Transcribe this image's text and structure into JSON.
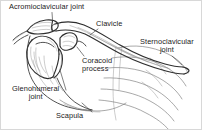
{
  "figure": {
    "type": "anatomical-line-illustration",
    "background_color": "#ffffff",
    "ink_color": "#3a3a3a",
    "text_color": "#1b1b1b",
    "width": 202,
    "height": 130
  },
  "labels": {
    "acromioclavicular_joint": "Acromioclavicular joint",
    "clavicle": "Clavicle",
    "sternoclavicular_joint_line1": "Sternoclavicular",
    "sternoclavicular_joint_line2": "joint",
    "coracoid_process_line1": "Coracoid",
    "coracoid_process_line2": "process",
    "glenohumeral_joint_line1": "Glenohumeral",
    "glenohumeral_joint_line2": "joint",
    "scapula": "Scapula"
  },
  "structures": [
    "clavicle",
    "acromion",
    "scapular spine",
    "coracoid process",
    "humeral head",
    "scapula body",
    "ribs",
    "sternum"
  ]
}
